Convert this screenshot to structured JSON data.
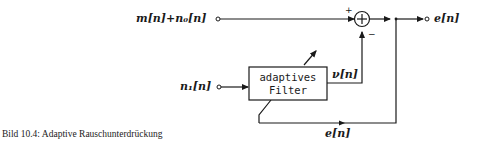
{
  "diagram": {
    "inputs": {
      "primary": "m[n]+n₀[n]",
      "reference": "n₁[n]"
    },
    "output": "e[n]",
    "filter_block": {
      "line1": "adaptives",
      "line2": "Filter"
    },
    "filter_output": "ν[n]",
    "feedback_label": "e[n]",
    "summer": {
      "symbol": "+",
      "plus_sign": "+",
      "minus_sign": "−"
    }
  },
  "caption": "Bild 10.4:  Adaptive Rauschunterdrückung"
}
